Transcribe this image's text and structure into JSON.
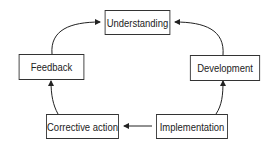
{
  "diagram": {
    "type": "cycle",
    "nodes": [
      {
        "id": "understanding",
        "label": "Understanding"
      },
      {
        "id": "development",
        "label": "Development"
      },
      {
        "id": "implementation",
        "label": "Implementation"
      },
      {
        "id": "corrective_action",
        "label": "Corrective action"
      },
      {
        "id": "feedback",
        "label": "Feedback"
      }
    ],
    "edges": [
      {
        "from": "implementation",
        "to": "development"
      },
      {
        "from": "development",
        "to": "understanding"
      },
      {
        "from": "implementation",
        "to": "corrective_action"
      },
      {
        "from": "corrective_action",
        "to": "feedback"
      },
      {
        "from": "feedback",
        "to": "understanding"
      }
    ],
    "colors": {
      "line": "#222222",
      "background": "#ffffff"
    }
  }
}
